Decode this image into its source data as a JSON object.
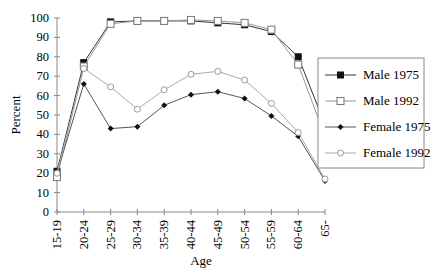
{
  "chart_data": {
    "type": "line",
    "title": "",
    "xlabel": "Age",
    "ylabel": "Percent",
    "ylim": [
      0,
      100
    ],
    "yticks": [
      "0",
      "10",
      "20",
      "30",
      "40",
      "50",
      "60",
      "70",
      "80",
      "90",
      "100"
    ],
    "categories": [
      "15-19",
      "20-24",
      "25-29",
      "30-34",
      "35-39",
      "40-44",
      "45-49",
      "50-54",
      "55-59",
      "60-64",
      "65-"
    ],
    "grid": false,
    "legend_position": "right",
    "series": [
      {
        "name": "Male 1975",
        "marker": "filled-square",
        "color": "#333333",
        "values": [
          21,
          77,
          98,
          98.5,
          98.5,
          98.5,
          97.5,
          96.5,
          93,
          80,
          45
        ]
      },
      {
        "name": "Male 1992",
        "marker": "open-square",
        "color": "#999999",
        "values": [
          18,
          75,
          97,
          98.5,
          98.5,
          99,
          98.5,
          97.5,
          94,
          76,
          39
        ]
      },
      {
        "name": "Female 1975",
        "marker": "filled-diamond",
        "color": "#555555",
        "values": [
          20,
          66,
          43,
          44,
          55,
          60.5,
          62,
          58.5,
          49.5,
          39,
          16
        ]
      },
      {
        "name": "Female 1992",
        "marker": "open-circle",
        "color": "#aaaaaa",
        "values": [
          20,
          74,
          64.5,
          53,
          63,
          71,
          72.5,
          68,
          56,
          41,
          17
        ]
      }
    ]
  }
}
